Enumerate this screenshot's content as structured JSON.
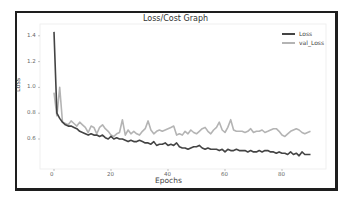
{
  "chart_data": {
    "type": "line",
    "title": "Loss/Cost Graph",
    "xlabel": "Epochs",
    "ylabel": "Loss",
    "xlim": [
      -5,
      92
    ],
    "ylim": [
      0.42,
      1.45
    ],
    "xticks": [
      0,
      20,
      40,
      60,
      80
    ],
    "yticks": [
      0.6,
      0.8,
      1.0,
      1.2,
      1.4
    ],
    "grid": false,
    "legend_position": "upper right",
    "series": [
      {
        "name": "Loss",
        "color": "#444444",
        "x": [
          0,
          1,
          2,
          3,
          4,
          5,
          6,
          7,
          8,
          9,
          10,
          11,
          12,
          13,
          14,
          15,
          16,
          17,
          18,
          19,
          20,
          21,
          22,
          23,
          24,
          25,
          26,
          27,
          28,
          29,
          30,
          31,
          32,
          33,
          34,
          35,
          36,
          37,
          38,
          39,
          40,
          41,
          42,
          43,
          44,
          45,
          46,
          47,
          48,
          49,
          50,
          51,
          52,
          53,
          54,
          55,
          56,
          57,
          58,
          59,
          60,
          61,
          62,
          63,
          64,
          65,
          66,
          67,
          68,
          69,
          70,
          71,
          72,
          73,
          74,
          75,
          76,
          77,
          78,
          79,
          80,
          81,
          82,
          83,
          84,
          85,
          86,
          87,
          88,
          89,
          90
        ],
        "values": [
          1.43,
          0.8,
          0.76,
          0.73,
          0.71,
          0.7,
          0.7,
          0.69,
          0.68,
          0.66,
          0.65,
          0.64,
          0.63,
          0.64,
          0.63,
          0.63,
          0.62,
          0.63,
          0.61,
          0.6,
          0.62,
          0.6,
          0.61,
          0.6,
          0.6,
          0.59,
          0.58,
          0.59,
          0.58,
          0.58,
          0.59,
          0.58,
          0.57,
          0.57,
          0.56,
          0.58,
          0.55,
          0.56,
          0.56,
          0.57,
          0.55,
          0.56,
          0.55,
          0.57,
          0.54,
          0.53,
          0.53,
          0.52,
          0.53,
          0.54,
          0.54,
          0.55,
          0.53,
          0.52,
          0.53,
          0.52,
          0.52,
          0.52,
          0.51,
          0.52,
          0.5,
          0.52,
          0.51,
          0.51,
          0.52,
          0.51,
          0.51,
          0.51,
          0.5,
          0.51,
          0.5,
          0.5,
          0.51,
          0.5,
          0.51,
          0.51,
          0.5,
          0.5,
          0.49,
          0.5,
          0.49,
          0.49,
          0.48,
          0.5,
          0.48,
          0.49,
          0.47,
          0.5,
          0.48,
          0.48,
          0.48
        ]
      },
      {
        "name": "val_Loss",
        "color": "#b4b4b4",
        "x": [
          0,
          1,
          2,
          3,
          4,
          5,
          6,
          7,
          8,
          9,
          10,
          11,
          12,
          13,
          14,
          15,
          16,
          17,
          18,
          19,
          20,
          21,
          22,
          23,
          24,
          25,
          26,
          27,
          28,
          29,
          30,
          31,
          32,
          33,
          34,
          35,
          36,
          37,
          38,
          39,
          40,
          41,
          42,
          43,
          44,
          45,
          46,
          47,
          48,
          49,
          50,
          51,
          52,
          53,
          54,
          55,
          56,
          57,
          58,
          59,
          60,
          61,
          62,
          63,
          64,
          65,
          66,
          67,
          68,
          69,
          70,
          71,
          72,
          73,
          74,
          75,
          76,
          77,
          78,
          79,
          80,
          81,
          82,
          83,
          84,
          85,
          86,
          87,
          88,
          89,
          90
        ],
        "values": [
          0.96,
          0.78,
          1.0,
          0.73,
          0.72,
          0.71,
          0.74,
          0.72,
          0.7,
          0.73,
          0.71,
          0.69,
          0.65,
          0.7,
          0.69,
          0.64,
          0.69,
          0.71,
          0.68,
          0.66,
          0.63,
          0.62,
          0.64,
          0.65,
          0.75,
          0.63,
          0.67,
          0.64,
          0.66,
          0.64,
          0.63,
          0.66,
          0.68,
          0.74,
          0.67,
          0.64,
          0.66,
          0.67,
          0.66,
          0.67,
          0.68,
          0.69,
          0.7,
          0.63,
          0.64,
          0.63,
          0.66,
          0.64,
          0.67,
          0.65,
          0.64,
          0.66,
          0.68,
          0.69,
          0.66,
          0.64,
          0.67,
          0.69,
          0.73,
          0.67,
          0.65,
          0.69,
          0.75,
          0.67,
          0.66,
          0.66,
          0.66,
          0.65,
          0.66,
          0.68,
          0.65,
          0.66,
          0.66,
          0.67,
          0.65,
          0.66,
          0.67,
          0.68,
          0.68,
          0.66,
          0.63,
          0.62,
          0.64,
          0.66,
          0.67,
          0.68,
          0.67,
          0.65,
          0.64,
          0.65,
          0.66
        ]
      }
    ]
  },
  "ui": {
    "legend_labels": [
      "Loss",
      "val_Loss"
    ],
    "xtick_labels": [
      "0",
      "20",
      "40",
      "60",
      "80"
    ],
    "ytick_labels": [
      "1.4",
      "1.2",
      "1.0",
      "0.8",
      "0.6"
    ]
  }
}
